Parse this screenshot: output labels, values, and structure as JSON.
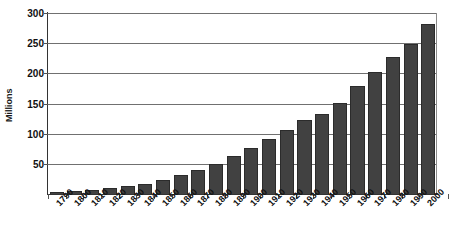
{
  "chart_data": {
    "type": "bar",
    "title": "",
    "xlabel": "",
    "ylabel": "Millions",
    "ylim": [
      0,
      300
    ],
    "yticks": [
      0,
      50,
      100,
      150,
      200,
      250,
      300
    ],
    "ytick_labels": [
      "",
      "50",
      "100",
      "150",
      "200",
      "250",
      "300"
    ],
    "grid": true,
    "legend": false,
    "bar_color": "#414141",
    "categories": [
      "1790",
      "1800",
      "1810",
      "1820",
      "1830",
      "1840",
      "1850",
      "1860",
      "1870",
      "1880",
      "1890",
      "1900",
      "1910",
      "1920",
      "1930",
      "1940",
      "1950",
      "1960",
      "1970",
      "1980",
      "1990",
      "2000"
    ],
    "values": [
      4,
      5,
      7,
      10,
      13,
      17,
      23,
      31,
      39,
      50,
      63,
      76,
      92,
      106,
      123,
      132,
      151,
      179,
      203,
      227,
      249,
      281
    ]
  }
}
